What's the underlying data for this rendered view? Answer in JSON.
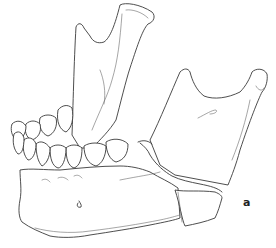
{
  "figure": {
    "panel_label": "a",
    "style": "black-line-drawing-on-white",
    "colors": {
      "background": "#ffffff",
      "line": "#3a3a3a"
    }
  }
}
